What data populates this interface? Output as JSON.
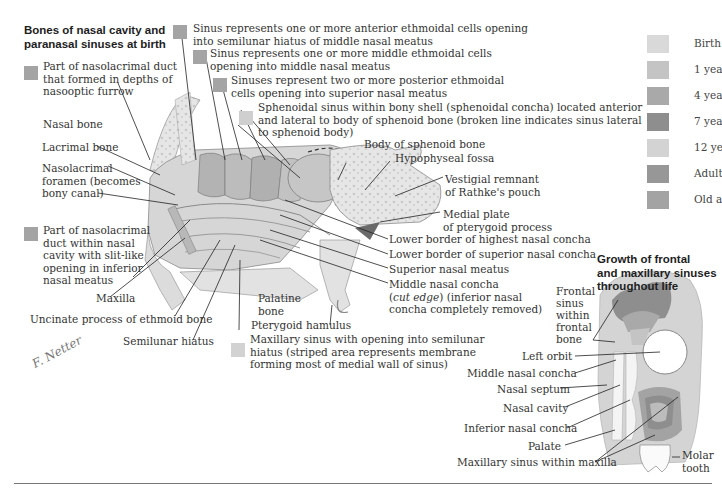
{
  "main_title": [
    "Bones of nasal cavity and",
    "paranasal sinuses at birth"
  ],
  "growth_title": [
    "Growth of frontal",
    "and maxillary sinuses",
    "throughout life"
  ],
  "legend": {
    "items": [
      {
        "label": "Birth",
        "color": "#d9d9d9"
      },
      {
        "label": "1 year",
        "color": "#c4c4c4"
      },
      {
        "label": "4 years",
        "color": "#a9a9a9"
      },
      {
        "label": "7 years",
        "color": "#8e8e8e"
      },
      {
        "label": "12 years",
        "color": "#d3d3d3"
      },
      {
        "label": "Adult",
        "color": "#979797"
      },
      {
        "label": "Old age",
        "color": "#a3a3a3"
      }
    ]
  },
  "keyed_labels": {
    "anterior_ethmoidal": {
      "lines": [
        "Sinus represents one or more anterior ethmoidal cells opening",
        "into semilunar hiatus of middle nasal meatus"
      ],
      "color": "#a4a4a4"
    },
    "middle_ethmoidal": {
      "lines": [
        "Sinus represents one or more middle ethmoidal cells",
        "opening into middle nasal meatus"
      ],
      "color": "#a4a4a4"
    },
    "posterior_ethmoidal": {
      "lines": [
        "Sinuses represent two or more posterior ethmoidal",
        "cells opening into superior nasal meatus"
      ],
      "color": "#a4a4a4"
    },
    "sphenoidal": {
      "lines": [
        "Sphenoidal sinus within bony shell (sphenoidal concha) located anterior",
        "and lateral to body of sphenoid bone (broken line indicates sinus lateral",
        "to sphenoid body)"
      ],
      "color": "#cfcfcf"
    },
    "nasolacrimal_furrow": {
      "lines": [
        "Part of nasolacrimal duct",
        "that formed in depths of",
        "nasooptic furrow"
      ],
      "color": "#a4a4a4"
    },
    "nasolacrimal_cavity": {
      "lines": [
        "Part of nasolacrimal",
        "duct within nasal",
        "cavity with slit-like",
        "opening in inferior",
        "nasal meatus"
      ],
      "color": "#a4a4a4"
    },
    "maxillary_sinus": {
      "lines": [
        "Maxillary sinus with opening into semilunar",
        "hiatus (striped area represents membrane",
        "forming most of medial wall of sinus)"
      ],
      "color": "#d2d2d2"
    }
  },
  "labels": {
    "nasal_bone": "Nasal bone",
    "lacrimal_bone": "Lacrimal bone",
    "nasolacrimal_foramen": [
      "Nasolacrimal",
      "foramen (becomes",
      "bony canal)"
    ],
    "maxilla": "Maxilla",
    "uncinate": "Uncinate process of ethmoid bone",
    "semilunar_hiatus": "Semilunar hiatus",
    "palatine_bone": [
      "Palatine",
      "bone"
    ],
    "pterygoid_hamulus": "Pterygoid hamulus",
    "body_sphenoid": "Body of sphenoid bone",
    "hypophyseal_fossa": "Hypophyseal fossa",
    "rathke": [
      "Vestigial remnant",
      "of Rathke's pouch"
    ],
    "medial_plate": [
      "Medial plate",
      "of pterygoid process"
    ],
    "lower_highest": "Lower border of highest nasal concha",
    "lower_superior": "Lower border of superior nasal concha",
    "superior_meatus": "Superior nasal meatus",
    "middle_concha": {
      "line1": "Middle nasal concha",
      "line2_italic": "cut edge",
      "line2_rest": " (inferior nasal",
      "line3": "concha completely removed)"
    },
    "frontal_sinus": [
      "Frontal",
      "sinus",
      "within",
      "frontal",
      "bone"
    ],
    "left_orbit": "Left orbit",
    "middle_nasal_concha_r": "Middle nasal concha",
    "nasal_septum": "Nasal septum",
    "nasal_cavity": "Nasal cavity",
    "inferior_concha": "Inferior nasal concha",
    "palate": "Palate",
    "maxillary_within": "Maxillary sinus within maxilla",
    "molar": [
      "Molar",
      "tooth"
    ]
  },
  "signature": "F. Netter"
}
